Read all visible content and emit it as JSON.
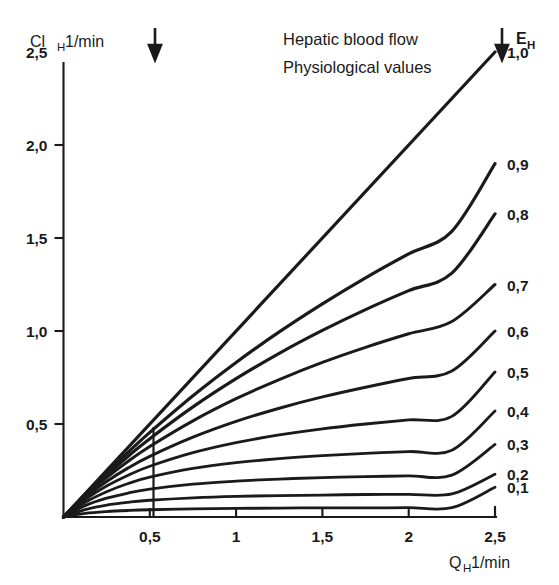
{
  "figure": {
    "title_lines": [
      "Hepatic blood flow",
      "Physiological values"
    ],
    "y_axis_title_main": "Cl",
    "y_axis_title_sub": "H",
    "y_axis_title_unit": "1/min",
    "x_axis_title_main": "Q",
    "x_axis_title_sub": "H",
    "x_axis_title_unit": "1/min",
    "series_legend_main": "E",
    "series_legend_sub": "H",
    "annotation_arrow_left": "down-arrow-physiological-low",
    "annotation_arrow_right": "down-arrow-physiological-high"
  },
  "chart_data": {
    "type": "line",
    "subtitle": "Physiological values",
    "xlabel": "Q_H 1/min",
    "ylabel": "Cl_H 1/min",
    "xlim": [
      0,
      2.5
    ],
    "ylim": [
      0,
      2.5
    ],
    "grid": false,
    "legend_position": "right-of-curve-ends",
    "legend_title": "E_H",
    "x_ticks": [
      {
        "value": 0.5,
        "label": "0,5"
      },
      {
        "value": 1.0,
        "label": "1"
      },
      {
        "value": 1.5,
        "label": "1,5"
      },
      {
        "value": 2.0,
        "label": "2"
      },
      {
        "value": 2.5,
        "label": "2,5"
      }
    ],
    "y_ticks": [
      {
        "value": 0.5,
        "label": "0,5"
      },
      {
        "value": 1.0,
        "label": "1,0"
      },
      {
        "value": 1.5,
        "label": "1,5"
      },
      {
        "value": 2.0,
        "label": "2,0"
      },
      {
        "value": 2.5,
        "label": "2,5"
      }
    ],
    "annotations": [
      {
        "name": "arrow-left",
        "x": 0.53,
        "text": ""
      },
      {
        "name": "arrow-right",
        "x": 2.54,
        "text": ""
      },
      {
        "name": "vertical-divider",
        "x": 0.52,
        "y_from": 0.0,
        "y_to": 0.46
      }
    ],
    "x": [
      0,
      0.125,
      0.25,
      0.375,
      0.5,
      0.75,
      1.0,
      1.25,
      1.5,
      1.75,
      2.0,
      2.25,
      2.5
    ],
    "series": [
      {
        "name": "1,0",
        "label": "1,0",
        "values": [
          0,
          0.125,
          0.25,
          0.375,
          0.5,
          0.75,
          1.0,
          1.25,
          1.5,
          1.75,
          2.0,
          2.25,
          2.5
        ]
      },
      {
        "name": "0,9",
        "label": "0,9",
        "values": [
          0,
          0.122,
          0.238,
          0.349,
          0.455,
          0.652,
          0.831,
          0.995,
          1.146,
          1.286,
          1.415,
          1.536,
          1.9
        ]
      },
      {
        "name": "0,8",
        "label": "0,8",
        "values": [
          0,
          0.118,
          0.226,
          0.327,
          0.421,
          0.592,
          0.744,
          0.88,
          1.003,
          1.115,
          1.217,
          1.311,
          1.63
        ]
      },
      {
        "name": "0,7",
        "label": "0,7",
        "values": [
          0,
          0.113,
          0.212,
          0.3,
          0.379,
          0.517,
          0.636,
          0.739,
          0.831,
          0.912,
          0.985,
          1.051,
          1.25
        ]
      },
      {
        "name": "0,6",
        "label": "0,6",
        "values": [
          0,
          0.105,
          0.191,
          0.264,
          0.326,
          0.429,
          0.514,
          0.585,
          0.646,
          0.698,
          0.745,
          0.785,
          1.0
        ]
      },
      {
        "name": "0,5",
        "label": "0,5",
        "values": [
          0,
          0.094,
          0.167,
          0.225,
          0.273,
          0.346,
          0.4,
          0.441,
          0.474,
          0.5,
          0.522,
          0.541,
          0.78
        ]
      },
      {
        "name": "0,4",
        "label": "0,4",
        "values": [
          0,
          0.079,
          0.136,
          0.18,
          0.214,
          0.261,
          0.292,
          0.314,
          0.33,
          0.342,
          0.352,
          0.359,
          0.57
        ]
      },
      {
        "name": "0,3",
        "label": "0,3",
        "values": [
          0,
          0.061,
          0.101,
          0.129,
          0.15,
          0.177,
          0.193,
          0.204,
          0.212,
          0.217,
          0.221,
          0.225,
          0.39
        ]
      },
      {
        "name": "0,2",
        "label": "0,2",
        "values": [
          0,
          0.04,
          0.064,
          0.079,
          0.09,
          0.103,
          0.111,
          0.115,
          0.118,
          0.121,
          0.122,
          0.124,
          0.23
        ]
      },
      {
        "name": "0,1",
        "label": "0,1",
        "values": [
          0,
          0.019,
          0.029,
          0.035,
          0.039,
          0.044,
          0.046,
          0.048,
          0.049,
          0.049,
          0.05,
          0.05,
          0.16
        ]
      }
    ]
  }
}
